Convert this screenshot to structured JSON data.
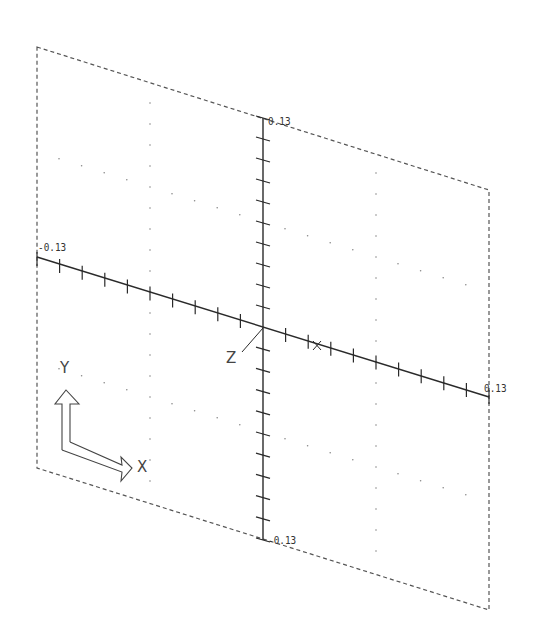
{
  "viewport": {
    "description": "CAD isometric XY plane view with axes and UCS icon",
    "colors": {
      "line": "#2a2a2a",
      "dash": "#555555",
      "grid": "#888888",
      "background": "#ffffff"
    }
  },
  "axes": {
    "vertical": {
      "max_label": "0.13",
      "min_label": "-0.13",
      "ticks_per_half": 10
    },
    "horizontal": {
      "min_label": "-0.13",
      "max_label": "0.13",
      "ticks_per_half": 10
    },
    "axis_marker_x": "X",
    "axis_marker_z": "Z"
  },
  "ucs_icon": {
    "y_label": "Y",
    "x_label": "X"
  }
}
